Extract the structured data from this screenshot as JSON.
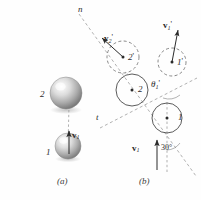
{
  "figure": {
    "type": "physics-diagram",
    "background_color": "#fefefe",
    "ink_color": "#2b2b2b",
    "width": 201,
    "height": 200
  },
  "panel_a": {
    "caption": "(a)",
    "sphere_upper": {
      "label": "2",
      "cx": 66,
      "cy": 93,
      "r": 16
    },
    "sphere_lower": {
      "label": "1",
      "cx": 68,
      "cy": 146,
      "r": 13
    },
    "velocity": {
      "label_bold": "v",
      "label_sub": "1",
      "label_prime": ""
    }
  },
  "panel_b": {
    "caption": "(b)",
    "axis_n": {
      "label": "n"
    },
    "axis_t": {
      "label": "t"
    },
    "angle_incidence": "30°",
    "angle_reflection": {
      "symbol": "θ",
      "sub": "1",
      "prime": "'"
    },
    "circle_1": {
      "label": "1",
      "cx": 167,
      "cy": 118,
      "r": 15
    },
    "circle_2": {
      "label": "2",
      "cx": 132,
      "cy": 90,
      "r": 16
    },
    "circle_1_after": {
      "label": "1",
      "prime": "'",
      "cx": 172,
      "cy": 62,
      "r": 14
    },
    "circle_2_after": {
      "label": "2",
      "prime": "'",
      "cx": 123,
      "cy": 57,
      "r": 16
    },
    "velocity_before": {
      "label_bold": "v",
      "label_sub": "1",
      "label_prime": ""
    },
    "velocity_1_after": {
      "label_bold": "v",
      "label_sub": "1",
      "label_prime": "'"
    },
    "velocity_2_after": {
      "label_bold": "v",
      "label_sub": "2",
      "label_prime": "'"
    }
  }
}
